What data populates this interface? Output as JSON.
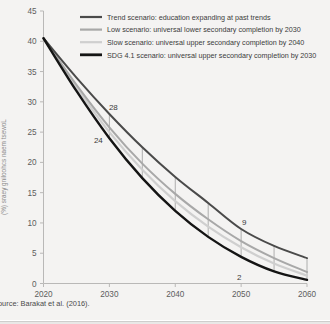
{
  "figure": {
    "source_note": "ource: Barakat et al. (2016).",
    "background_color": "#f4f3f2"
  },
  "legend": {
    "position": "top-center",
    "items": [
      {
        "label": "Trend scenario: education expanding at past trends",
        "color": "#4a4a4a",
        "width": 2.2,
        "key": "trend"
      },
      {
        "label": "Low scenario: universal lower secondary completion by 2030",
        "color": "#a8a8a8",
        "width": 2.2,
        "key": "low"
      },
      {
        "label": "Slow scenario: universal upper secondary completion by 2040",
        "color": "#cfcfcf",
        "width": 2.2,
        "key": "slow"
      },
      {
        "label": "SDG 4.1 scenario: universal upper secondary completion by 2030",
        "color": "#141414",
        "width": 2.8,
        "key": "sdg"
      }
    ]
  },
  "chart_data": {
    "type": "line",
    "title": "",
    "subtitle": "",
    "xlabel": "",
    "ylabel": "(%) sraey gniloohcs naem tsewoL",
    "xlim": [
      2020,
      2060
    ],
    "ylim": [
      0,
      45
    ],
    "grid": false,
    "x_ticks": [
      2020,
      2030,
      2040,
      2050,
      2060
    ],
    "y_ticks": [
      0,
      5,
      10,
      15,
      20,
      25,
      30,
      35,
      40,
      45
    ],
    "x": [
      2020,
      2025,
      2030,
      2035,
      2040,
      2045,
      2050,
      2055,
      2060
    ],
    "series": [
      {
        "name": "Trend scenario: education expanding at past trends",
        "key": "trend",
        "color": "#4a4a4a",
        "width": 2.0,
        "values": [
          40.5,
          34.0,
          28.0,
          22.5,
          17.6,
          13.3,
          9.0,
          6.2,
          4.2
        ]
      },
      {
        "name": "Low scenario: universal lower secondary completion by 2030",
        "key": "low",
        "color": "#a8a8a8",
        "width": 2.0,
        "values": [
          40.5,
          32.8,
          25.8,
          19.8,
          14.8,
          10.6,
          7.0,
          4.2,
          1.9
        ]
      },
      {
        "name": "Slow scenario: universal upper secondary completion by 2040",
        "key": "slow",
        "color": "#cfcfcf",
        "width": 2.2,
        "values": [
          40.5,
          32.4,
          25.0,
          18.8,
          13.6,
          9.4,
          6.0,
          3.3,
          1.3
        ]
      },
      {
        "name": "SDG 4.1 scenario: universal upper secondary completion by 2030",
        "key": "sdg",
        "color": "#141414",
        "width": 2.4,
        "values": [
          40.5,
          31.8,
          24.0,
          17.4,
          12.0,
          7.7,
          4.4,
          2.0,
          0.6
        ]
      }
    ],
    "connectors_x": [
      2030,
      2035,
      2040,
      2045,
      2050,
      2055,
      2060
    ],
    "annotations": [
      {
        "text": "28",
        "x": 2030,
        "y": 28.0,
        "dx": 4,
        "dy": -4,
        "series": "trend"
      },
      {
        "text": "24",
        "x": 2030,
        "y": 24.0,
        "dx": -11,
        "dy": 5,
        "series": "sdg"
      },
      {
        "text": "9",
        "x": 2050,
        "y": 9.0,
        "dx": 3,
        "dy": -4,
        "series": "trend"
      },
      {
        "text": "2",
        "x": 2050,
        "y": 2.0,
        "dx": -2,
        "dy": 9,
        "series": "sdg"
      }
    ]
  }
}
